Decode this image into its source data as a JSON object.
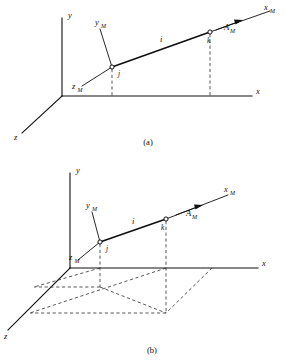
{
  "figure": {
    "panels": [
      {
        "id": "a",
        "caption": "(a)",
        "global_axes": [
          {
            "name": "y-axis",
            "label": "y"
          },
          {
            "name": "x-axis",
            "label": "x"
          },
          {
            "name": "z-axis",
            "label": "z"
          }
        ],
        "member_axes": [
          {
            "name": "xm-axis",
            "label": "x",
            "subscript": "M"
          },
          {
            "name": "ym-axis",
            "label": "y",
            "subscript": "M"
          },
          {
            "name": "zm-axis",
            "label": "z",
            "subscript": "M"
          }
        ],
        "member_label": "i",
        "node_labels": [
          "j",
          "k"
        ],
        "vector": {
          "label": "A",
          "subscript": "M"
        },
        "projection_lines": "two dashed vertical drop lines from nodes j and k to the x-axis"
      },
      {
        "id": "b",
        "caption": "(b)",
        "global_axes": [
          {
            "name": "y-axis",
            "label": "y"
          },
          {
            "name": "x-axis",
            "label": "x"
          },
          {
            "name": "z-axis",
            "label": "z"
          }
        ],
        "member_axes": [
          {
            "name": "xm-axis",
            "label": "x",
            "subscript": "M"
          },
          {
            "name": "ym-axis",
            "label": "y",
            "subscript": "M"
          },
          {
            "name": "zm-axis",
            "label": "z",
            "subscript": "M"
          }
        ],
        "member_label": "i",
        "node_labels": [
          "j",
          "k"
        ],
        "vector": {
          "label": "A",
          "subscript": "M"
        },
        "projection_lines": "dashed projection of the member onto the horizontal x-z plane forming a parallelogram"
      }
    ],
    "colors": {
      "line": "#101010",
      "dashed": "#3a3a3a",
      "background": "#ffffff"
    }
  }
}
